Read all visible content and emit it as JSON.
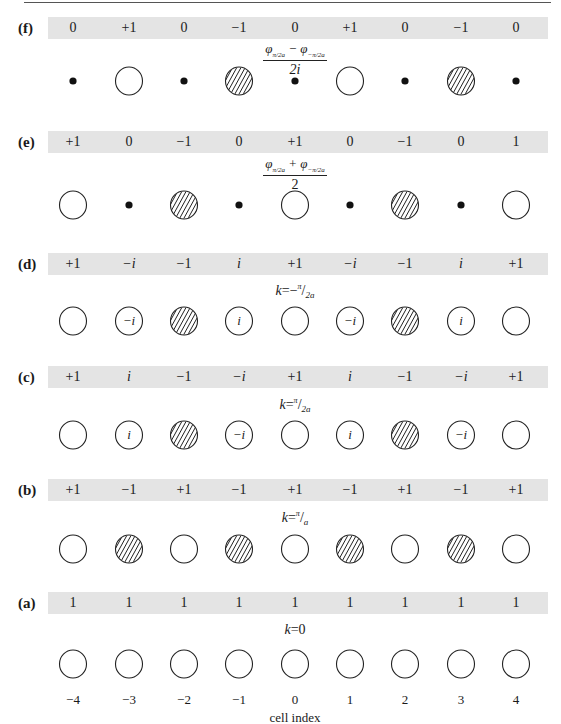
{
  "figure": {
    "columns_x": [
      73,
      129,
      184,
      239,
      295,
      350,
      405,
      461,
      516
    ],
    "panels": [
      {
        "id": "f",
        "label": "(f)",
        "band_top": 17,
        "site_y": 81,
        "values": [
          "0",
          "+1",
          "0",
          "−1",
          "0",
          "+1",
          "0",
          "−1",
          "0"
        ],
        "sites": [
          "dot",
          "open",
          "dot",
          "hatched",
          "dot",
          "open",
          "dot",
          "hatched",
          "dot"
        ],
        "site_text": [
          "",
          "",
          "",
          "",
          "",
          "",
          "",
          "",
          ""
        ],
        "caption_type": "fraction",
        "caption_numerator": "φπ/2a − φ−π/2a",
        "caption_denominator": "2i",
        "caption_top": 41
      },
      {
        "id": "e",
        "label": "(e)",
        "band_top": 131,
        "site_y": 205,
        "values": [
          "+1",
          "0",
          "−1",
          "0",
          "+1",
          "0",
          "−1",
          "0",
          "1"
        ],
        "sites": [
          "open",
          "dot",
          "hatched",
          "dot",
          "open",
          "dot",
          "hatched",
          "dot",
          "open"
        ],
        "site_text": [
          "",
          "",
          "",
          "",
          "",
          "",
          "",
          "",
          ""
        ],
        "caption_type": "fraction",
        "caption_numerator": "φπ/2a + φ−π/2a",
        "caption_denominator": "2",
        "caption_top": 156
      },
      {
        "id": "d",
        "label": "(d)",
        "band_top": 253,
        "site_y": 321,
        "values": [
          "+1",
          "−i",
          "−1",
          "i",
          "+1",
          "−i",
          "−1",
          "i",
          "+1"
        ],
        "sites": [
          "open",
          "open",
          "hatched",
          "open",
          "open",
          "open",
          "hatched",
          "open",
          "open"
        ],
        "site_text": [
          "",
          "−i",
          "",
          "i",
          "",
          "−i",
          "",
          "i",
          ""
        ],
        "caption_type": "k",
        "caption": "k = −π/2a",
        "caption_top": 284
      },
      {
        "id": "c",
        "label": "(c)",
        "band_top": 366,
        "site_y": 435,
        "values": [
          "+1",
          "i",
          "−1",
          "−i",
          "+1",
          "i",
          "−1",
          "−i",
          "+1"
        ],
        "sites": [
          "open",
          "open",
          "hatched",
          "open",
          "open",
          "open",
          "hatched",
          "open",
          "open"
        ],
        "site_text": [
          "",
          "i",
          "",
          "−i",
          "",
          "i",
          "",
          "−i",
          ""
        ],
        "caption_type": "k",
        "caption": "k = π/2a",
        "caption_top": 398
      },
      {
        "id": "b",
        "label": "(b)",
        "band_top": 479,
        "site_y": 549,
        "values": [
          "+1",
          "−1",
          "+1",
          "−1",
          "+1",
          "−1",
          "+1",
          "−1",
          "+1"
        ],
        "sites": [
          "open",
          "hatched",
          "open",
          "hatched",
          "open",
          "hatched",
          "open",
          "hatched",
          "open"
        ],
        "site_text": [
          "",
          "",
          "",
          "",
          "",
          "",
          "",
          "",
          ""
        ],
        "caption_type": "k",
        "caption": "k = π/a",
        "caption_top": 511
      },
      {
        "id": "a",
        "label": "(a)",
        "band_top": 592,
        "site_y": 664,
        "values": [
          "1",
          "1",
          "1",
          "1",
          "1",
          "1",
          "1",
          "1",
          "1"
        ],
        "sites": [
          "open",
          "open",
          "open",
          "open",
          "open",
          "open",
          "open",
          "open",
          "open"
        ],
        "site_text": [
          "",
          "",
          "",
          "",
          "",
          "",
          "",
          "",
          ""
        ],
        "caption_type": "k",
        "caption": "k = 0",
        "caption_top": 624
      }
    ],
    "cell_indices": [
      "−4",
      "−3",
      "−2",
      "−1",
      "0",
      "1",
      "2",
      "3",
      "4"
    ],
    "x_axis_label": "cell index"
  },
  "captions": {
    "f_num_a": "φ",
    "f_num_a_sub": "π/2a",
    "f_num_op": " − ",
    "f_num_b": "φ",
    "f_num_b_sub": "−π/2a",
    "f_den": "2i",
    "e_num_a": "φ",
    "e_num_a_sub": "π/2a",
    "e_num_op": " + ",
    "e_num_b": "φ",
    "e_num_b_sub": "−π/2a",
    "e_den": "2",
    "d_k": "k",
    "d_eq": "=−",
    "d_sup": "π",
    "d_slash": "/",
    "d_sub": "2a",
    "c_k": "k",
    "c_eq": "=",
    "c_sup": "π",
    "c_slash": "/",
    "c_sub": "2a",
    "b_k": "k",
    "b_eq": "=",
    "b_sup": "π",
    "b_slash": "/",
    "b_sub": "a",
    "a_k": "k",
    "a_eq": "=0"
  }
}
